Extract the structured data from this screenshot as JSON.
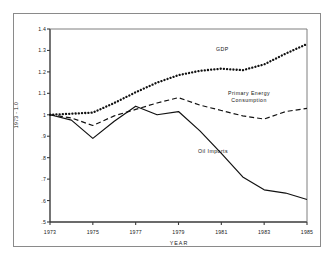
{
  "chart_data": {
    "type": "line",
    "title": "",
    "xlabel": "YEAR",
    "ylabel": "1973 = 1.0",
    "xlim": [
      1973,
      1985
    ],
    "ylim": [
      0.5,
      1.4
    ],
    "grid": false,
    "legend": "inline-annotations",
    "xticks": [
      "1973",
      "1975",
      "1977",
      "1979",
      "1981",
      "1983",
      "1985"
    ],
    "xtick_values": [
      1973,
      1975,
      1977,
      1979,
      1981,
      1983,
      1985
    ],
    "yticks": [
      "1.4",
      "1.3",
      "1.2",
      "1.1",
      "1",
      ".9",
      ".8",
      ".7",
      ".6",
      ".5"
    ],
    "ytick_values": [
      1.4,
      1.3,
      1.2,
      1.1,
      1.0,
      0.9,
      0.8,
      0.7,
      0.6,
      0.5
    ],
    "x": [
      1973,
      1974,
      1975,
      1976,
      1977,
      1978,
      1979,
      1980,
      1981,
      1982,
      1983,
      1984,
      1985
    ],
    "series": [
      {
        "name": "GDP",
        "style": "dotted",
        "label": "GDP",
        "values": [
          1.0,
          1.005,
          1.01,
          1.055,
          1.105,
          1.15,
          1.185,
          1.205,
          1.215,
          1.208,
          1.235,
          1.285,
          1.33
        ]
      },
      {
        "name": "Primary Energy Consumption",
        "style": "dashed",
        "label": "Primary Energy\nConsumption",
        "label_line1": "Primary Energy",
        "label_line2": "Consumption",
        "values": [
          1.0,
          0.985,
          0.95,
          0.995,
          1.025,
          1.055,
          1.08,
          1.045,
          1.02,
          0.995,
          0.98,
          1.015,
          1.03
        ]
      },
      {
        "name": "Oil Imports",
        "style": "solid",
        "label": "Oil  Imports",
        "values": [
          1.0,
          0.975,
          0.89,
          0.97,
          1.04,
          1.0,
          1.015,
          0.925,
          0.82,
          0.71,
          0.65,
          0.635,
          0.605
        ]
      }
    ]
  },
  "axis": {
    "y_title": "1973 - 1.0",
    "x_title": "YEAR"
  }
}
